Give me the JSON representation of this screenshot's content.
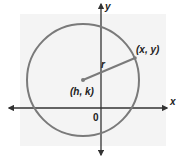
{
  "diagram": {
    "type": "circle-on-coordinate-plane",
    "axes": {
      "x_label": "x",
      "y_label": "y",
      "origin_label": "0"
    },
    "circle": {
      "center_label": "(h, k)",
      "point_label": "(x, y)",
      "radius_label": "r"
    },
    "colors": {
      "background_shade": "#f4f4f4",
      "circle_stroke": "#7a7a7a",
      "axis_stroke": "#333333",
      "radius_stroke": "#7a7a7a",
      "text": "#222222"
    }
  }
}
